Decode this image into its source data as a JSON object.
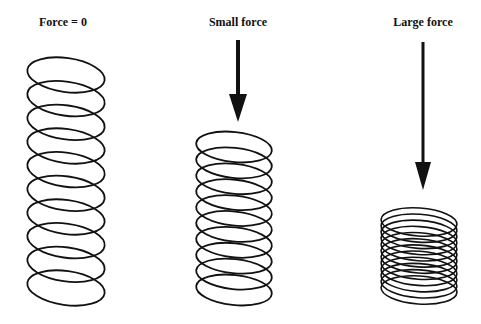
{
  "diagram": {
    "panels": [
      {
        "label": "Force = 0",
        "arrow": false,
        "coils": 10,
        "state": "relaxed"
      },
      {
        "label": "Small force",
        "arrow": true,
        "coils": 10,
        "state": "partially compressed"
      },
      {
        "label": "Large force",
        "arrow": true,
        "coils": 12,
        "state": "fully compressed"
      }
    ],
    "colors": {
      "ink": "#111111",
      "background": "#ffffff"
    }
  }
}
